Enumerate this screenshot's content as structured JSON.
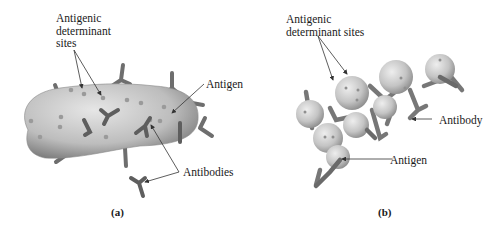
{
  "panels": [
    {
      "id": "a",
      "caption": "(a)",
      "labels": {
        "determinant_sites": "Antigenic\ndeterminant\nsites",
        "antigen": "Antigen",
        "antibodies": "Antibodies"
      }
    },
    {
      "id": "b",
      "caption": "(b)",
      "labels": {
        "determinant_sites": "Antigenic\ndeterminant sites",
        "antibody": "Antibody",
        "antigen": "Antigen"
      }
    }
  ],
  "colors": {
    "antigen_fill": "#c9c9c9",
    "antigen_shadow": "#8a8a8a",
    "antibody": "#6e6e6e",
    "leader_line": "#333333"
  }
}
